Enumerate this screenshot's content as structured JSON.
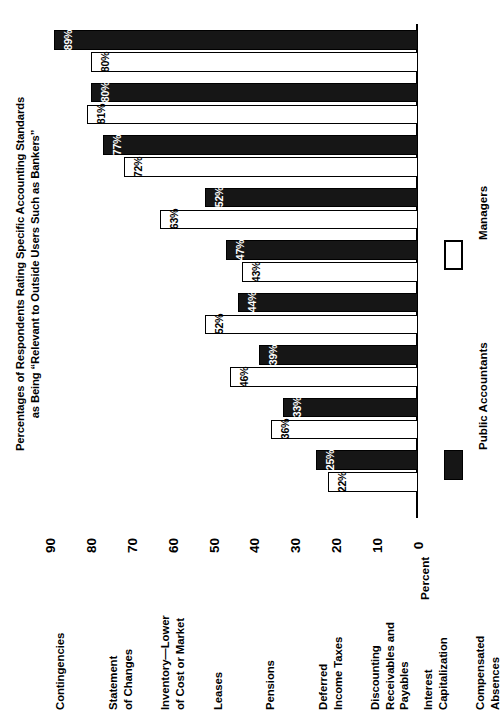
{
  "title": {
    "line1": "Percentages of Respondents Rating Specific Accounting Standards",
    "line2": "as Being “Relevant to Outside Users Such as Bankers”"
  },
  "axis_title": "Percent",
  "legend": {
    "items": [
      {
        "label": "Public Accountants",
        "style": "dark",
        "color": "#161616"
      },
      {
        "label": "Managers",
        "style": "light",
        "color": "#ffffff"
      }
    ]
  },
  "chart_data": {
    "type": "bar",
    "orientation": "vertical-rotated",
    "title": "Percentages of Respondents Rating Specific Accounting Standards as Being “Relevant to Outside Users Such as Bankers”",
    "xlabel": "",
    "ylabel": "Percent",
    "ylim": [
      0,
      90
    ],
    "yticks": [
      0,
      10,
      20,
      30,
      40,
      50,
      60,
      70,
      80,
      90
    ],
    "ticklabels": [
      "0",
      "10",
      "20",
      "30",
      "40",
      "50",
      "60",
      "70",
      "80",
      "90"
    ],
    "grid": false,
    "legend_position": "right",
    "categories": [
      "Contingencies",
      "Statement of Changes",
      "Inventory—Lower of Cost or Market",
      "Leases",
      "Pensions",
      "Deferred Income Taxes",
      "Discounting Receivables and Payables",
      "Interest Capitalization",
      "Compensated Absences"
    ],
    "category_lines": [
      [
        "Contingencies"
      ],
      [
        "Statement",
        "of Changes"
      ],
      [
        "Inventory—Lower",
        "of Cost or Market"
      ],
      [
        "Leases"
      ],
      [
        "Pensions"
      ],
      [
        "Deferred",
        "Income Taxes"
      ],
      [
        "Discounting",
        "Receivables and",
        "Payables"
      ],
      [
        "Interest",
        "Capitalization"
      ],
      [
        "Compensated",
        "Absences"
      ]
    ],
    "series": [
      {
        "name": "Public Accountants",
        "style": "dark",
        "values": [
          89,
          80,
          77,
          52,
          47,
          44,
          39,
          33,
          25
        ],
        "labels": [
          "89%",
          "80%",
          "77%",
          "52%",
          "47%",
          "44%",
          "39%",
          "33%",
          "25%"
        ]
      },
      {
        "name": "Managers",
        "style": "light",
        "values": [
          80,
          81,
          72,
          63,
          43,
          52,
          46,
          36,
          22
        ],
        "labels": [
          "80%",
          "81%",
          "72%",
          "63%",
          "43%",
          "52%",
          "46%",
          "36%",
          "22%"
        ]
      }
    ]
  }
}
